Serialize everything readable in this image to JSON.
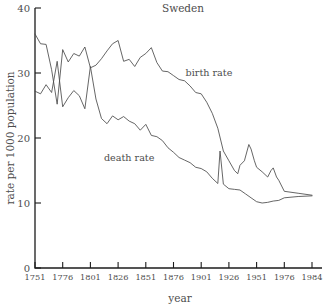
{
  "chart_data": {
    "type": "line",
    "title": "Sweden",
    "xlabel": "year",
    "ylabel": "rate per 1000 population",
    "xlim": [
      1751,
      1984
    ],
    "ylim": [
      0,
      40
    ],
    "grid": false,
    "legend_position": "inline-annotations",
    "xticks": [
      "1751",
      "1776",
      "1801",
      "1826",
      "1851",
      "1876",
      "1901",
      "1926",
      "1951",
      "1976",
      "1984"
    ],
    "xtick_values": [
      1751,
      1776,
      1801,
      1826,
      1851,
      1876,
      1901,
      1926,
      1951,
      1976,
      1984
    ],
    "yticks": [
      "0",
      "10",
      "20",
      "30",
      "40"
    ],
    "ytick_values": [
      0,
      10,
      20,
      30,
      40
    ],
    "annotations": [
      {
        "text": "birth rate",
        "x": 1908,
        "y": 29.5
      },
      {
        "text": "death rate",
        "x": 1836,
        "y": 16.5
      }
    ],
    "series": [
      {
        "name": "birth rate",
        "color": "#4a4a4a",
        "x": [
          1751,
          1756,
          1761,
          1766,
          1771,
          1776,
          1781,
          1786,
          1791,
          1796,
          1801,
          1806,
          1811,
          1816,
          1821,
          1826,
          1831,
          1836,
          1841,
          1846,
          1851,
          1856,
          1861,
          1866,
          1871,
          1876,
          1881,
          1886,
          1891,
          1896,
          1901,
          1906,
          1911,
          1916,
          1921,
          1926,
          1931,
          1934,
          1936,
          1940,
          1944,
          1946,
          1949,
          1951,
          1956,
          1961,
          1964,
          1966,
          1969,
          1971,
          1976,
          1980,
          1984
        ],
        "values": [
          36.0,
          34.5,
          34.4,
          30.5,
          25.2,
          33.6,
          31.7,
          33.0,
          32.6,
          34.0,
          30.8,
          31.2,
          32.2,
          33.4,
          34.5,
          35.0,
          31.8,
          32.1,
          31.0,
          32.4,
          33.0,
          33.9,
          31.6,
          30.3,
          30.2,
          29.6,
          29.0,
          28.8,
          28.0,
          27.0,
          26.8,
          25.5,
          23.8,
          21.5,
          18.0,
          16.5,
          15.0,
          14.5,
          15.8,
          16.5,
          19.0,
          18.3,
          16.5,
          15.5,
          14.8,
          14.0,
          15.0,
          15.4,
          14.0,
          13.5,
          11.8,
          11.5,
          11.2
        ]
      },
      {
        "name": "death rate",
        "color": "#4a4a4a",
        "x": [
          1751,
          1756,
          1761,
          1766,
          1771,
          1776,
          1781,
          1786,
          1791,
          1796,
          1801,
          1806,
          1811,
          1816,
          1821,
          1826,
          1831,
          1836,
          1841,
          1846,
          1851,
          1856,
          1861,
          1866,
          1871,
          1876,
          1881,
          1886,
          1891,
          1896,
          1901,
          1906,
          1911,
          1916,
          1918,
          1921,
          1926,
          1931,
          1936,
          1941,
          1946,
          1951,
          1956,
          1961,
          1966,
          1971,
          1976,
          1980,
          1984
        ],
        "values": [
          27.2,
          26.8,
          28.2,
          27.0,
          31.8,
          24.8,
          26.2,
          27.3,
          26.5,
          24.5,
          31.0,
          26.0,
          23.0,
          22.2,
          23.4,
          22.8,
          23.3,
          22.6,
          22.2,
          21.2,
          22.1,
          20.4,
          20.2,
          19.6,
          18.5,
          17.8,
          17.0,
          16.6,
          16.2,
          15.5,
          15.3,
          14.8,
          13.8,
          13.0,
          18.0,
          12.9,
          12.2,
          12.1,
          12.0,
          11.4,
          10.8,
          10.2,
          10.0,
          10.1,
          10.3,
          10.4,
          10.8,
          11.0,
          11.1
        ]
      }
    ]
  },
  "axis_titles": {
    "x": "year",
    "y": "rate per 1000 population"
  },
  "title": "Sweden"
}
